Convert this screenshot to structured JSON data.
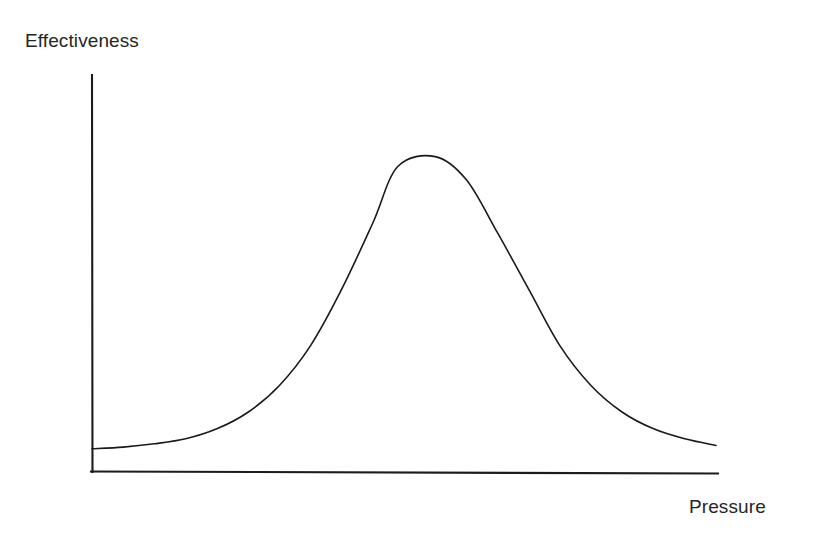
{
  "chart_data": {
    "type": "line",
    "title": "",
    "subtitle": "",
    "xlabel": "Pressure",
    "ylabel": "Effectiveness",
    "grid": false,
    "legend": null,
    "legend_position": "none",
    "axis_style": "open-L-axes-no-ticks",
    "xlim": [
      0,
      100
    ],
    "ylim": [
      0,
      100
    ],
    "x_tick_labels": [],
    "y_tick_labels": [],
    "annotations": [],
    "series": [
      {
        "name": "Effectiveness",
        "color": "#1a1a1a",
        "line_width": 1.6,
        "x": [
          0,
          5,
          10,
          15,
          20,
          25,
          30,
          35,
          40,
          45,
          49,
          55,
          60,
          65,
          70,
          75,
          80,
          85,
          90,
          95,
          100
        ],
        "y": [
          7,
          7.5,
          8.5,
          10,
          13,
          18,
          26,
          38,
          55,
          75,
          92,
          95,
          88,
          72,
          55,
          38,
          26,
          18,
          13,
          10,
          8
        ]
      }
    ]
  },
  "labels": {
    "y_axis": "Effectiveness",
    "x_axis": "Pressure"
  },
  "colors": {
    "background": "#ffffff",
    "axis": "#1c1c1c",
    "curve": "#1a1a1a",
    "text": "#262626"
  }
}
